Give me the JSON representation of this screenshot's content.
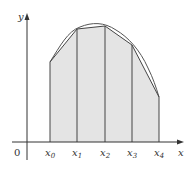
{
  "diagram": {
    "title": "",
    "axes": {
      "x_label": "x",
      "y_label": "y",
      "origin_label": "0"
    },
    "ticks": [
      {
        "base": "x",
        "sub": "0"
      },
      {
        "base": "x",
        "sub": "1"
      },
      {
        "base": "x",
        "sub": "2"
      },
      {
        "base": "x",
        "sub": "3"
      },
      {
        "base": "x",
        "sub": "4"
      }
    ],
    "colors": {
      "fill": "#e4e4e4",
      "stroke": "#444444",
      "axis": "#333333"
    }
  }
}
